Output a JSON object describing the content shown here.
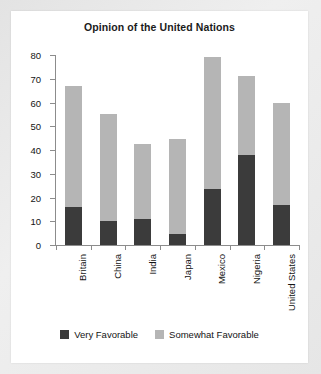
{
  "chart_data": {
    "type": "bar",
    "subtype": "stacked-vertical",
    "title": "Opinion of the United Nations",
    "xlabel": "",
    "ylabel": "",
    "ylim": [
      0,
      80
    ],
    "yticks": [
      0,
      10,
      20,
      30,
      40,
      50,
      60,
      70,
      80
    ],
    "grid": false,
    "legend_position": "bottom-center",
    "categories": [
      "Britain",
      "China",
      "India",
      "Japan",
      "Mexico",
      "Nigeria",
      "United States"
    ],
    "series": [
      {
        "name": "Very Favorable",
        "color": "#3b3b3b",
        "values": [
          16,
          10,
          11,
          4.5,
          23.5,
          38,
          17
        ]
      },
      {
        "name": "Somewhat Favorable",
        "color": "#b5b5b5",
        "values": [
          51,
          45,
          31.5,
          40,
          55.5,
          33,
          43
        ]
      }
    ],
    "totals": [
      67,
      55,
      42.5,
      44.5,
      79,
      71,
      60
    ]
  },
  "legend": {
    "items": [
      {
        "label": "Very Favorable",
        "color": "#3b3b3b"
      },
      {
        "label": "Somewhat Favorable",
        "color": "#b5b5b5"
      }
    ]
  }
}
